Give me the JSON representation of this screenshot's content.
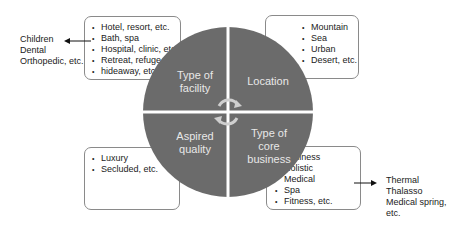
{
  "colors": {
    "quadrant": "#6b6b6b",
    "divider": "#ffffff",
    "box_border": "#8a8a8a",
    "text": "#222222",
    "label": "#e8e8e8"
  },
  "quadrants": [
    {
      "id": "top-left",
      "label_lines": [
        "Type of",
        "facility"
      ]
    },
    {
      "id": "top-right",
      "label_lines": [
        "Location"
      ]
    },
    {
      "id": "bottom-left",
      "label_lines": [
        "Aspired",
        "quality"
      ]
    },
    {
      "id": "bottom-right",
      "label_lines": [
        "Type of",
        "core",
        "business"
      ]
    }
  ],
  "boxes": {
    "facility": [
      "Hotel, resort, etc.",
      "Bath, spa",
      "Hospital, clinic, etc.",
      "Retreat, refuge,",
      "hideaway, etc."
    ],
    "location": [
      "Mountain",
      "Sea",
      "Urban",
      "Desert, etc."
    ],
    "quality": [
      "Luxury",
      "Secluded, etc."
    ],
    "core_business": [
      "Wellness",
      "Holistic",
      "Medical",
      "Spa",
      "Fitness, etc."
    ]
  },
  "notes": {
    "hospital": [
      "Children",
      "Dental",
      "Orthopedic, etc."
    ],
    "spa": [
      "Thermal",
      "Thalasso",
      "Medical spring,",
      "etc."
    ]
  },
  "center_icon": "cycle-arrows-icon"
}
